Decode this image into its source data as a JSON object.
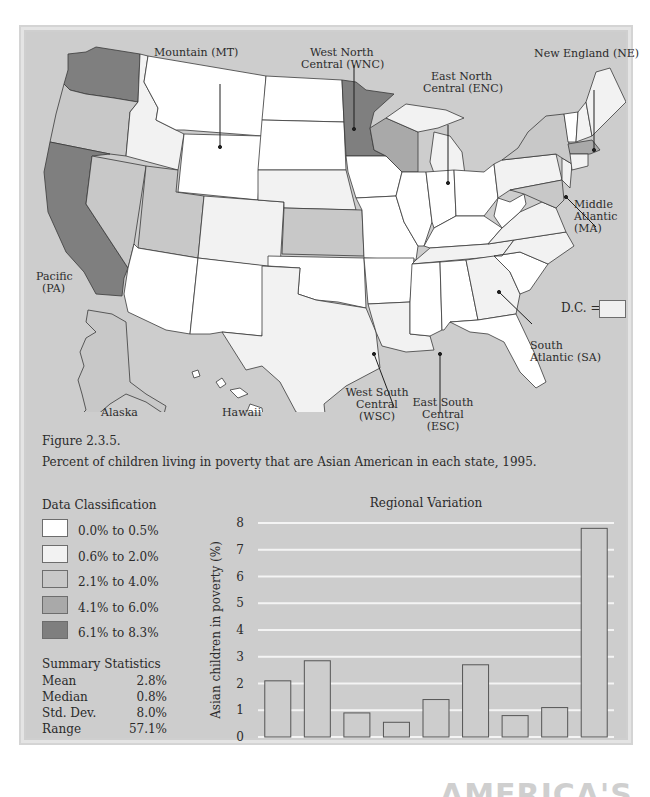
{
  "figure": {
    "number": "Figure 2.3.5.",
    "caption": "Percent of children living in poverty that are Asian American in each state, 1995."
  },
  "map": {
    "region_labels": {
      "mountain": "Mountain (MT)",
      "wnc_line1": "West North",
      "wnc_line2": "Central (WNC)",
      "enc_line1": "East North",
      "enc_line2": "Central (ENC)",
      "ne": "New England (NE)",
      "ma_line1": "Middle",
      "ma_line2": "Atlantic",
      "ma_line3": "(MA)",
      "pa_line1": "Pacific",
      "pa_line2": "(PA)",
      "sa_line1": "South",
      "sa_line2": "Atlantic (SA)",
      "wsc_line1": "West South",
      "wsc_line2": "Central",
      "wsc_line3": "(WSC)",
      "esc_line1": "East South",
      "esc_line2": "Central",
      "esc_line3": "(ESC)",
      "alaska": "Alaska",
      "hawaii": "Hawaii",
      "dc": "D.C. ="
    },
    "colors": {
      "class1": "#ffffff",
      "class2": "#f2f2f2",
      "class3": "#c8c8c8",
      "class4": "#a9a9a9",
      "class5": "#7f7f7f",
      "water": "#cdcdcd",
      "outline": "#3a3a3a"
    }
  },
  "legend": {
    "title": "Data Classification",
    "items": [
      {
        "label": "0.0% to 0.5%",
        "color": "#ffffff"
      },
      {
        "label": "0.6% to 2.0%",
        "color": "#f2f2f2"
      },
      {
        "label": "2.1% to 4.0%",
        "color": "#c8c8c8"
      },
      {
        "label": "4.1% to 6.0%",
        "color": "#a9a9a9"
      },
      {
        "label": "6.1% to 8.3%",
        "color": "#7f7f7f"
      }
    ]
  },
  "summary": {
    "title": "Summary Statistics",
    "rows": [
      {
        "key": "Mean",
        "value": "2.8%"
      },
      {
        "key": "Median",
        "value": "0.8%"
      },
      {
        "key": "Std. Dev.",
        "value": "8.0%"
      },
      {
        "key": "Range",
        "value": "57.1%"
      }
    ]
  },
  "chart_data": {
    "type": "bar",
    "title": "Regional Variation",
    "xlabel": "",
    "ylabel": "Asian children  in poverty (%)",
    "categories": [
      "MA",
      "NE",
      "SA",
      "ESC",
      "ENC",
      "WNC",
      "WSC",
      "MT",
      "PA"
    ],
    "values": [
      2.1,
      2.85,
      0.9,
      0.55,
      1.4,
      2.7,
      0.8,
      1.1,
      7.8
    ],
    "ylim": [
      0,
      8
    ],
    "yticks": [
      "0",
      "1",
      "2",
      "3",
      "4",
      "5",
      "6",
      "7",
      "8"
    ],
    "grid": true,
    "bar_color": "#cdcdcd",
    "grid_color": "#f4f4f4"
  },
  "footer": {
    "partial_text": "AMERICA'S CHILDREN"
  }
}
